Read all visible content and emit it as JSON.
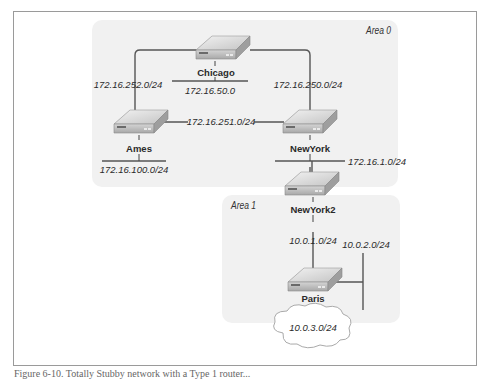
{
  "areas": [
    {
      "id": "area0",
      "label": "Area 0"
    },
    {
      "id": "area1",
      "label": "Area 1"
    }
  ],
  "routers": [
    {
      "id": "chicago",
      "label": "Chicago"
    },
    {
      "id": "ames",
      "label": "Ames"
    },
    {
      "id": "newyork",
      "label": "NewYork"
    },
    {
      "id": "newyork2",
      "label": "NewYork2"
    },
    {
      "id": "paris",
      "label": "Paris"
    }
  ],
  "networks": {
    "ames_chicago": "172.16.252.0/24",
    "chicago_lan": "172.16.50.0",
    "chicago_newyork": "172.16.250.0/24",
    "ames_newyork": "172.16.251.0/24",
    "ames_lan": "172.16.100.0/24",
    "newyork_newyork2": "172.16.1.0/24",
    "newyork2_paris": "10.0.1.0/24",
    "paris_lan": "10.0.2.0/24",
    "paris_cloud": "10.0.3.0/24"
  },
  "caption": "Figure 6-10. Totally Stubby network with a Type 1 router..."
}
